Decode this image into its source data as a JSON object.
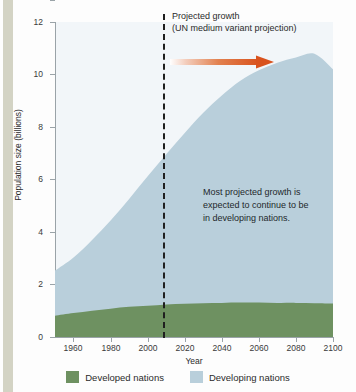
{
  "chart_data": {
    "type": "area",
    "title": "",
    "xlabel": "Year",
    "ylabel": "Population size (billions)",
    "xlim": [
      1950,
      2100
    ],
    "ylim": [
      0,
      12
    ],
    "xticks": [
      "1960",
      "1980",
      "2000",
      "2020",
      "2040",
      "2060",
      "2080",
      "2100"
    ],
    "xtick_values": [
      1960,
      1980,
      2000,
      2020,
      2040,
      2060,
      2080,
      2100
    ],
    "yticks": [
      "0",
      "2",
      "4",
      "6",
      "8",
      "10",
      "12"
    ],
    "ytick_values": [
      0,
      2,
      4,
      6,
      8,
      10,
      12
    ],
    "grid": false,
    "legend_position": "bottom",
    "stacked": true,
    "x": [
      1950,
      1960,
      1970,
      1980,
      1990,
      2000,
      2010,
      2020,
      2030,
      2040,
      2050,
      2060,
      2070,
      2080,
      2090,
      2100
    ],
    "series": [
      {
        "name": "Developed nations",
        "color": "#6e9161",
        "values": [
          0.81,
          0.91,
          1.0,
          1.08,
          1.15,
          1.19,
          1.24,
          1.27,
          1.29,
          1.3,
          1.31,
          1.31,
          1.3,
          1.3,
          1.29,
          1.28
        ]
      },
      {
        "name": "Developing nations",
        "color": "#b9cfdb",
        "values": [
          1.72,
          2.12,
          2.7,
          3.36,
          4.11,
          4.93,
          5.72,
          6.5,
          7.25,
          7.9,
          8.45,
          8.85,
          9.15,
          9.35,
          9.5,
          8.92
        ]
      }
    ],
    "totals": [
      2.53,
      3.03,
      3.7,
      4.44,
      5.26,
      6.12,
      6.96,
      7.77,
      8.54,
      9.2,
      9.76,
      10.16,
      10.45,
      10.65,
      10.79,
      10.2
    ],
    "annotations": [
      {
        "name": "projection-divider",
        "type": "vline",
        "x": 2010,
        "style": "dashed",
        "color": "#1f1f1f"
      },
      {
        "name": "projection-label",
        "type": "text",
        "line1": "Projected growth",
        "line2": "(UN medium variant projection)"
      },
      {
        "name": "projection-arrow",
        "type": "arrow",
        "direction": "right",
        "color_start": "#ffffff",
        "color_end": "#d9531e"
      },
      {
        "name": "developing-growth-note",
        "type": "text",
        "line1": "Most projected growth is",
        "line2": "expected to continue to be",
        "line3": "in developing nations."
      }
    ]
  },
  "axes": {
    "x_title": "Year",
    "y_title": "Population size (billions)",
    "x_ticks": [
      "1960",
      "1980",
      "2000",
      "2020",
      "2040",
      "2060",
      "2080",
      "2100"
    ],
    "y_ticks": [
      "12",
      "10",
      "8",
      "6",
      "4",
      "2",
      "0"
    ]
  },
  "annotations": {
    "projection": {
      "line1": "Projected growth",
      "line2": "(UN medium variant projection)"
    },
    "inline_note": {
      "line1": "Most projected growth is",
      "line2": "expected to continue to be",
      "line3": "in developing nations."
    }
  },
  "legend": {
    "items": [
      {
        "label": "Developed nations",
        "color": "#6e9161"
      },
      {
        "label": "Developing nations",
        "color": "#b9cfdb"
      }
    ]
  },
  "colors": {
    "developed": "#6e9161",
    "developing": "#b9cfdb",
    "arrow": "#d9531e",
    "divider": "#1f1f1f",
    "plot_bg": "#f2f6f9",
    "margin_strip": "#d3d3c4"
  }
}
